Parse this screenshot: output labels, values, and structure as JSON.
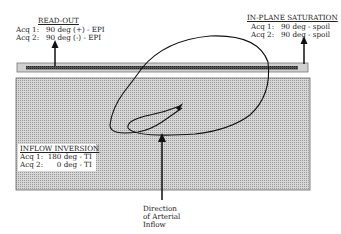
{
  "readout": {
    "title": "READ-OUT",
    "lines": [
      "Acq 1:   90 deg (+) - EPI",
      "Acq 2:   90 deg (-) - EPI"
    ]
  },
  "saturation": {
    "title": "IN-PLANE SATURATION",
    "lines": [
      "Acq 1:   90 deg - spoil",
      "Acq 2:   90 deg - spoil"
    ]
  },
  "inversion": {
    "title": "INFLOW INVERSION",
    "lines": [
      "Acq 1:  180 deg - TI",
      "Acq 2:      0 deg - TI"
    ]
  },
  "direction_label": [
    "Direction",
    "of Arterial",
    "Inflow"
  ],
  "colors": {
    "slab": "#c8c8c8",
    "slab_bar": "#444444",
    "region": "#c4c4c4",
    "line": "#111111"
  }
}
